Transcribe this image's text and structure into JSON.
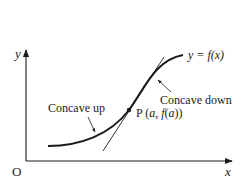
{
  "diagram": {
    "axes": {
      "y_label": "y",
      "x_label": "x",
      "origin_label": "O"
    },
    "curve_label": {
      "prefix": "y = ",
      "func": "f",
      "arg": "(x)"
    },
    "point_label": {
      "name": "P",
      "open": " (",
      "a": "a",
      "comma": ", ",
      "f": "f",
      "inner": "(",
      "a2": "a",
      "close": "))"
    },
    "annotations": {
      "concave_up": "Concave up",
      "concave_down": "Concave down"
    },
    "colors": {
      "line": "#1a1a1a",
      "text": "#222222",
      "background": "#ffffff"
    }
  }
}
